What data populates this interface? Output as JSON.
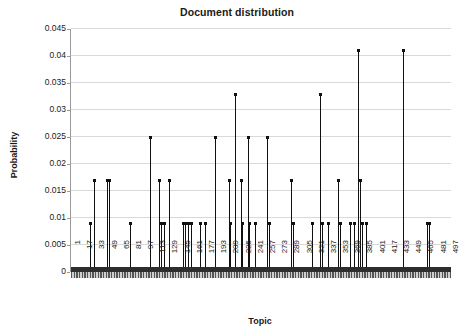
{
  "chart_data": {
    "type": "line",
    "title": "Document distribution",
    "xlabel": "Topic",
    "ylabel": "Probability",
    "grid": true,
    "legend": false,
    "xlim": [
      1,
      500
    ],
    "ylim": [
      0,
      0.045
    ],
    "y_ticks": [
      0,
      0.005,
      0.01,
      0.015,
      0.02,
      0.025,
      0.03,
      0.035,
      0.04,
      0.045
    ],
    "y_tick_labels": [
      "0",
      "0.005",
      "0.01",
      "0.015",
      "0.02",
      "0.025",
      "0.03",
      "0.035",
      "0.04",
      "0.045"
    ],
    "x_ticks": [
      1,
      17,
      33,
      49,
      65,
      81,
      97,
      113,
      129,
      145,
      161,
      177,
      193,
      209,
      225,
      241,
      257,
      273,
      289,
      305,
      321,
      337,
      353,
      369,
      385,
      401,
      417,
      433,
      449,
      465,
      481,
      497
    ],
    "x_tick_labels": [
      "1",
      "17",
      "33",
      "49",
      "65",
      "81",
      "97",
      "113",
      "129",
      "145",
      "161",
      "177",
      "193",
      "209",
      "225",
      "241",
      "257",
      "273",
      "289",
      "305",
      "321",
      "337",
      "353",
      "369",
      "385",
      "401",
      "417",
      "433",
      "449",
      "465",
      "481",
      "497"
    ],
    "baseline_value": 0.0009,
    "series_name": "Probability",
    "points": [
      {
        "x": 26,
        "y": 0.0089
      },
      {
        "x": 31,
        "y": 0.0169
      },
      {
        "x": 48,
        "y": 0.0169
      },
      {
        "x": 51,
        "y": 0.0169
      },
      {
        "x": 79,
        "y": 0.0089
      },
      {
        "x": 105,
        "y": 0.0249
      },
      {
        "x": 116,
        "y": 0.0169
      },
      {
        "x": 119,
        "y": 0.0089
      },
      {
        "x": 123,
        "y": 0.0089
      },
      {
        "x": 130,
        "y": 0.0169
      },
      {
        "x": 148,
        "y": 0.0089
      },
      {
        "x": 151,
        "y": 0.0089
      },
      {
        "x": 155,
        "y": 0.0089
      },
      {
        "x": 159,
        "y": 0.0089
      },
      {
        "x": 170,
        "y": 0.0089
      },
      {
        "x": 177,
        "y": 0.0089
      },
      {
        "x": 190,
        "y": 0.0249
      },
      {
        "x": 208,
        "y": 0.0169
      },
      {
        "x": 210,
        "y": 0.0089
      },
      {
        "x": 216,
        "y": 0.0328
      },
      {
        "x": 224,
        "y": 0.0169
      },
      {
        "x": 226,
        "y": 0.0089
      },
      {
        "x": 233,
        "y": 0.0249
      },
      {
        "x": 235,
        "y": 0.0089
      },
      {
        "x": 242,
        "y": 0.0089
      },
      {
        "x": 259,
        "y": 0.0249
      },
      {
        "x": 261,
        "y": 0.0089
      },
      {
        "x": 290,
        "y": 0.0169
      },
      {
        "x": 292,
        "y": 0.0089
      },
      {
        "x": 318,
        "y": 0.0089
      },
      {
        "x": 328,
        "y": 0.0328
      },
      {
        "x": 330,
        "y": 0.0089
      },
      {
        "x": 338,
        "y": 0.0089
      },
      {
        "x": 352,
        "y": 0.0169
      },
      {
        "x": 354,
        "y": 0.0089
      },
      {
        "x": 368,
        "y": 0.0089
      },
      {
        "x": 372,
        "y": 0.0089
      },
      {
        "x": 378,
        "y": 0.041
      },
      {
        "x": 381,
        "y": 0.0169
      },
      {
        "x": 383,
        "y": 0.0089
      },
      {
        "x": 389,
        "y": 0.0089
      },
      {
        "x": 437,
        "y": 0.041
      },
      {
        "x": 468,
        "y": 0.0089
      },
      {
        "x": 471,
        "y": 0.0089
      }
    ]
  }
}
